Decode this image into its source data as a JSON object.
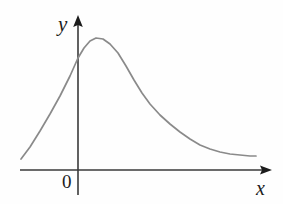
{
  "figure": {
    "background_color": "#fefefe",
    "axis_color": "#3a3a3a",
    "curve_color": "#8a8a8a",
    "label_color": "#1c1c1c"
  },
  "labels": {
    "y_axis": "y",
    "x_axis": "x",
    "origin": "0"
  },
  "chart_data": {
    "type": "line",
    "title": "",
    "xlabel": "x",
    "ylabel": "y",
    "origin_label": "0",
    "grid": false,
    "legend": null,
    "axes": {
      "x_axis_pixel_y": 170,
      "y_axis_pixel_x": 78,
      "x_axis_start_px": 20,
      "x_axis_end_px": 272,
      "y_axis_top_px": 16,
      "y_axis_bottom_px": 195,
      "x_arrow": true,
      "y_arrow": true
    },
    "series": [
      {
        "name": "curve",
        "color": "#8a8a8a",
        "points_px": [
          [
            21,
            159
          ],
          [
            30,
            147
          ],
          [
            40,
            131
          ],
          [
            50,
            114
          ],
          [
            60,
            96
          ],
          [
            70,
            76
          ],
          [
            78,
            58
          ],
          [
            84,
            48
          ],
          [
            90,
            41
          ],
          [
            96,
            38
          ],
          [
            103,
            39
          ],
          [
            110,
            44
          ],
          [
            118,
            53
          ],
          [
            126,
            66
          ],
          [
            134,
            80
          ],
          [
            142,
            93
          ],
          [
            150,
            104
          ],
          [
            160,
            115
          ],
          [
            170,
            124
          ],
          [
            180,
            132
          ],
          [
            190,
            139
          ],
          [
            200,
            145
          ],
          [
            210,
            149
          ],
          [
            220,
            152
          ],
          [
            230,
            154
          ],
          [
            240,
            155
          ],
          [
            250,
            156
          ],
          [
            256,
            156
          ]
        ],
        "peak_px": [
          96,
          38
        ],
        "asymptote_px_y": 156
      }
    ]
  }
}
